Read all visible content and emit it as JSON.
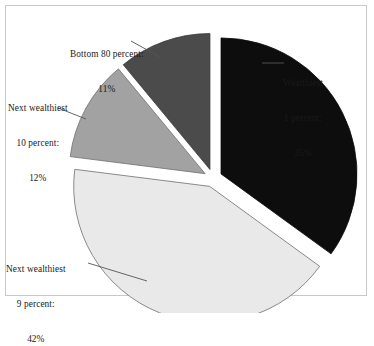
{
  "chart_data": {
    "type": "pie",
    "title": "",
    "categories": [
      "Wealthiest 1 percent",
      "Next wealthiest 9 percent",
      "Next wealthiest 10 percent",
      "Bottom 80 percent"
    ],
    "values": [
      35,
      42,
      12,
      11
    ],
    "value_labels": [
      "35%",
      "42%",
      "12%",
      "11%"
    ],
    "colors": [
      "#0d0d0d",
      "#e9e9e9",
      "#a2a2a2",
      "#4b4b4b"
    ],
    "legend": "none",
    "grid": false,
    "exploded": true,
    "start_angle_deg": 0,
    "direction": "clockwise",
    "slices": [
      {
        "name": "Wealthiest 1 percent",
        "percent": 35,
        "color": "#0d0d0d",
        "start_deg": 0,
        "sweep_deg": 126,
        "explode": 9,
        "stroke": "#0d0d0d"
      },
      {
        "name": "Next wealthiest 9 percent",
        "percent": 42,
        "color": "#e9e9e9",
        "start_deg": 126,
        "sweep_deg": 151.2,
        "explode": 9,
        "stroke": "#6f6f6f"
      },
      {
        "name": "Next wealthiest 10 percent",
        "percent": 12,
        "color": "#a2a2a2",
        "start_deg": 277.2,
        "sweep_deg": 43.2,
        "explode": 9,
        "stroke": "#6f6f6f"
      },
      {
        "name": "Bottom 80 percent",
        "percent": 11,
        "color": "#4b4b4b",
        "start_deg": 320.4,
        "sweep_deg": 39.6,
        "explode": 9,
        "stroke": "#3a3a3a"
      }
    ]
  },
  "labels": {
    "wealthiest_1": {
      "line1": "Wealthiest",
      "line2": "1 percent:",
      "line3": "35%"
    },
    "next_wealthiest_9": {
      "line1": "Next wealthiest",
      "line2": "9 percent:",
      "line3": "42%"
    },
    "next_wealthiest_10": {
      "line1": "Next wealthiest",
      "line2": "10 percent:",
      "line3": "12%"
    },
    "bottom_80": {
      "line1": "Bottom 80 percent:",
      "line2": "11%"
    }
  }
}
